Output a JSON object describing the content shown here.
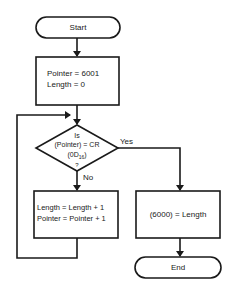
{
  "flowchart": {
    "start": {
      "label": "Start"
    },
    "init": {
      "lines": [
        "Pointer = 6001",
        "Length = 0"
      ]
    },
    "decision": {
      "line1": "Is",
      "line2": "(Pointer) = CR",
      "line3_main": "(0D",
      "line3_sub": "16",
      "line3_end": ")",
      "line4": "?",
      "yes_label": "Yes",
      "no_label": "No"
    },
    "increment": {
      "lines": [
        "Length = Length + 1",
        "Pointer = Pointer + 1"
      ]
    },
    "store": {
      "label": "(6000) = Length"
    },
    "end": {
      "label": "End"
    }
  },
  "colors": {
    "stroke": "#1a1a1a",
    "background": "#ffffff"
  }
}
